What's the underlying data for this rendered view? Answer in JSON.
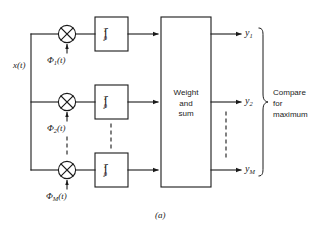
{
  "figure": {
    "caption": "(a)",
    "input_signal": "x(t)",
    "reference_prefix": "Φ",
    "reference_suffix": "(t)",
    "branches": [
      {
        "index": "1",
        "phi_sub": "1",
        "output_sub": "1"
      },
      {
        "index": "2",
        "phi_sub": "2",
        "output_sub": "2"
      },
      {
        "index": "M",
        "phi_sub": "M",
        "output_sub": "M"
      }
    ],
    "integrator": {
      "symbol": "∫",
      "upper_limit": "T",
      "lower_limit": "0"
    },
    "multiplier_symbol": "⊗",
    "weight_block": {
      "line1": "Weight",
      "line2": "and",
      "line3": "sum"
    },
    "compare_block": {
      "line1": "Compare",
      "line2": "for",
      "line3": "maximum"
    },
    "output_prefix": "y",
    "colors": {
      "line": "#1a1a1a",
      "text": "#1a1a1a",
      "background": "#ffffff"
    }
  }
}
